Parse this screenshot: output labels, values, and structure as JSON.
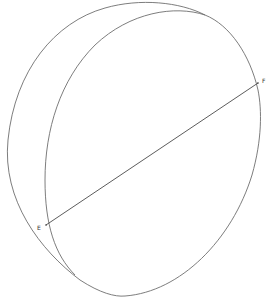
{
  "diagram": {
    "points": [
      {
        "id": "E",
        "label": "E"
      },
      {
        "id": "F",
        "label": "F"
      }
    ],
    "segments": [
      {
        "from": "E",
        "to": "F"
      }
    ],
    "colors": {
      "curve": "#6e6e6e",
      "chord": "#4a4a4a",
      "label": "#333333",
      "background": "#ffffff"
    }
  }
}
